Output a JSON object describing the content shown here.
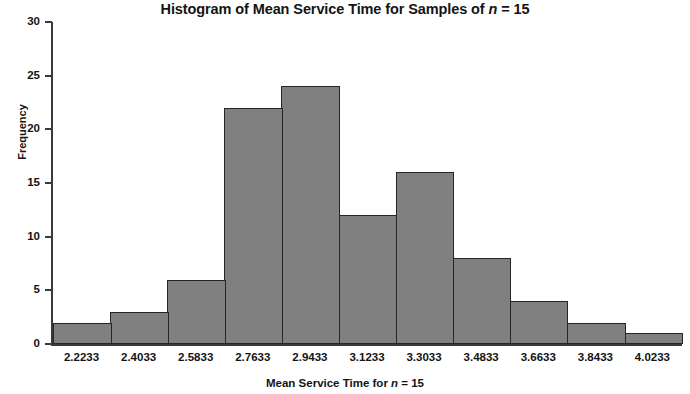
{
  "chart_data": {
    "type": "bar",
    "title": "Histogram of Mean Service Time for Samples of n = 15",
    "title_prefix": "Histogram of Mean Service Time for Samples of ",
    "title_italic": "n",
    "title_suffix": " = 15",
    "xlabel": "Mean Service Time for n = 15",
    "xlabel_prefix": "Mean Service Time for ",
    "xlabel_italic": "n",
    "xlabel_suffix": " = 15",
    "ylabel": "Frequency",
    "categories": [
      "2.2233",
      "2.4033",
      "2.5833",
      "2.7633",
      "2.9433",
      "3.1233",
      "3.3033",
      "3.4833",
      "3.6633",
      "3.8433",
      "4.0233"
    ],
    "values": [
      2,
      3,
      6,
      22,
      24,
      12,
      16,
      8,
      4,
      2,
      1
    ],
    "ylim": [
      0,
      30
    ],
    "yticks": [
      0,
      5,
      10,
      15,
      20,
      25,
      30
    ],
    "ytick_labels": [
      "0",
      "5",
      "10",
      "15",
      "20",
      "25",
      "30"
    ],
    "grid": false,
    "legend": false,
    "bar_color": "#808080",
    "bar_border_color": "#262626",
    "axis_color": "#3a3a3a",
    "text_color": "#141414"
  }
}
